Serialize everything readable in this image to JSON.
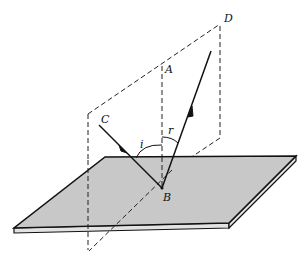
{
  "figure": {
    "labels": {
      "A": "A",
      "B": "B",
      "C": "C",
      "D": "D",
      "i": "i",
      "r": "r"
    },
    "colors": {
      "plate_top": "#c8c8c8",
      "plate_edge": "#e0e0e0",
      "lines": "#111111",
      "background": "#ffffff"
    },
    "elements": {
      "plane_of_incidence": "dashed plane",
      "normal": "dashed line AB",
      "incident_ray": "ray from C to B",
      "reflected_ray": "ray from B upward",
      "angle_of_incidence": "i",
      "angle_of_reflection": "r",
      "reflecting_surface": "gray plate"
    }
  }
}
